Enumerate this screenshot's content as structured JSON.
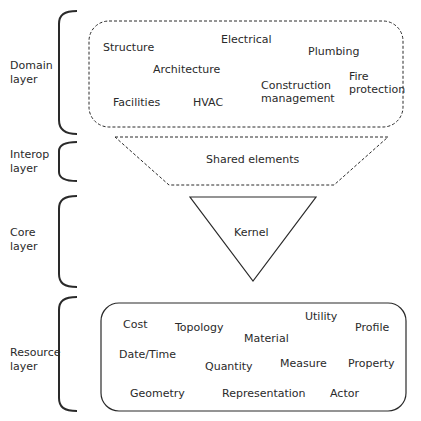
{
  "layers": [
    {
      "id": "domain",
      "label_line1": "Domain",
      "label_line2": "layer",
      "items": [
        "Structure",
        "Electrical",
        "Plumbing",
        "Architecture",
        "Construction management",
        "Fire protection",
        "Facilities",
        "HVAC"
      ]
    },
    {
      "id": "interop",
      "label_line1": "Interop",
      "label_line2": "layer",
      "items": [
        "Shared elements"
      ]
    },
    {
      "id": "core",
      "label_line1": "Core",
      "label_line2": "layer",
      "items": [
        "Kernel"
      ]
    },
    {
      "id": "resource",
      "label_line1": "Resource",
      "label_line2": "layer",
      "items": [
        "Cost",
        "Topology",
        "Utility",
        "Profile",
        "Material",
        "Date/Time",
        "Quantity",
        "Measure",
        "Property",
        "Geometry",
        "Representation",
        "Actor"
      ]
    }
  ],
  "domain": {
    "structure": "Structure",
    "electrical": "Electrical",
    "plumbing": "Plumbing",
    "architecture": "Architecture",
    "construction_1": "Construction",
    "construction_2": "management",
    "fire_1": "Fire",
    "fire_2": "protection",
    "facilities": "Facilities",
    "hvac": "HVAC"
  },
  "interop": {
    "shared": "Shared elements"
  },
  "core": {
    "kernel": "Kernel"
  },
  "resource": {
    "cost": "Cost",
    "topology": "Topology",
    "utility": "Utility",
    "profile": "Profile",
    "material": "Material",
    "datetime": "Date/Time",
    "quantity": "Quantity",
    "measure": "Measure",
    "property": "Property",
    "geometry": "Geometry",
    "representation": "Representation",
    "actor": "Actor"
  },
  "colors": {
    "stroke": "#2a2a2a",
    "background": "#ffffff"
  }
}
